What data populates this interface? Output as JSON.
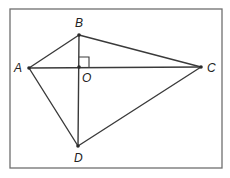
{
  "diagram": {
    "type": "geometry",
    "frame": {
      "x": 10,
      "y": 9,
      "width": 212,
      "height": 159
    },
    "points": {
      "A": {
        "label": "A",
        "x": 29,
        "y": 68
      },
      "B": {
        "label": "B",
        "x": 79,
        "y": 35
      },
      "C": {
        "label": "C",
        "x": 201,
        "y": 67
      },
      "D": {
        "label": "D",
        "x": 78,
        "y": 146
      },
      "O": {
        "label": "O",
        "x": 79,
        "y": 67
      }
    },
    "segments": [
      {
        "from": "A",
        "to": "B"
      },
      {
        "from": "B",
        "to": "C"
      },
      {
        "from": "C",
        "to": "D"
      },
      {
        "from": "D",
        "to": "A"
      },
      {
        "from": "A",
        "to": "C"
      },
      {
        "from": "B",
        "to": "D"
      }
    ],
    "right_angle": {
      "at": "O",
      "between": [
        "OB",
        "OC"
      ],
      "size": 10
    },
    "colors": {
      "line": "#3a3a3a",
      "frame": "#6f6f6f",
      "text": "#222222"
    }
  }
}
